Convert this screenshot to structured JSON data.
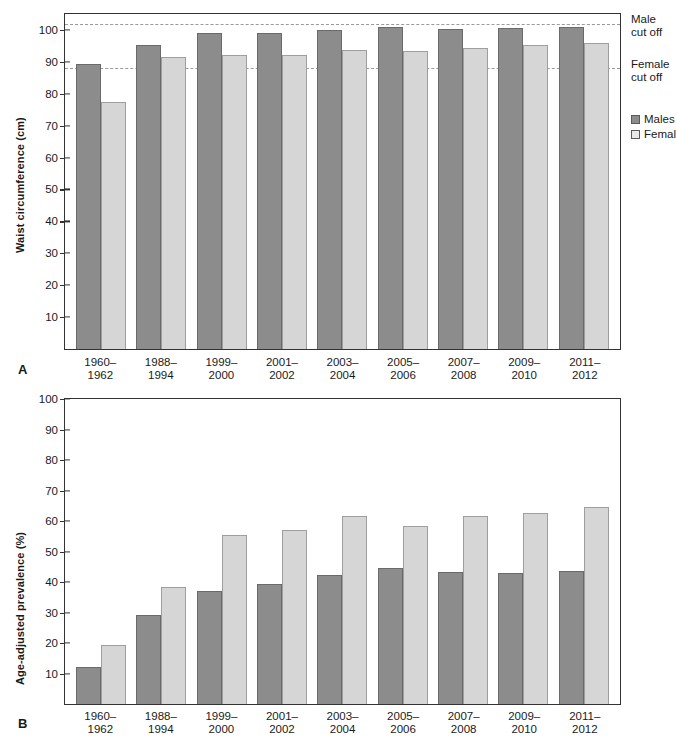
{
  "figure": {
    "panel_a_letter": "A",
    "panel_b_letter": "B"
  },
  "legend": {
    "males_label": "Males",
    "females_label": "Females",
    "male_color": "#8c8c8c",
    "female_color": "#d6d6d6"
  },
  "annotations": {
    "male_cut_off": "Male\ncut off",
    "female_cut_off": "Female\ncut off"
  },
  "chart_data": [
    {
      "type": "bar",
      "panel": "A",
      "title": "",
      "xlabel": "",
      "ylabel": "Waist circumference (cm)",
      "ylim": [
        0,
        105
      ],
      "yticks": [
        10,
        20,
        30,
        40,
        50,
        60,
        70,
        80,
        90,
        100
      ],
      "ytick_labels": [
        "10",
        "20",
        "30",
        "40",
        "50",
        "60",
        "70",
        "80",
        "90",
        "100"
      ],
      "grid": false,
      "legend_position": "right",
      "categories": [
        "1960–1962",
        "1988–1994",
        "1999–2000",
        "2001–2002",
        "2003–2004",
        "2005–2006",
        "2007–2008",
        "2009–2010",
        "2011–2012"
      ],
      "series": [
        {
          "name": "Males",
          "color": "#8c8c8c",
          "values": [
            89.3,
            95.4,
            99.0,
            99.1,
            100.1,
            101.0,
            100.4,
            100.5,
            100.8
          ]
        },
        {
          "name": "Females",
          "color": "#d6d6d6",
          "values": [
            77.3,
            91.5,
            92.2,
            92.2,
            93.8,
            93.3,
            94.4,
            95.2,
            95.8
          ]
        }
      ],
      "reference_lines": [
        {
          "label": "Male cut off",
          "value": 102,
          "style": "dashed",
          "color": "#9a9a9a"
        },
        {
          "label": "Female cut off",
          "value": 88,
          "style": "dashed",
          "color": "#9a9a9a"
        }
      ]
    },
    {
      "type": "bar",
      "panel": "B",
      "title": "",
      "xlabel": "",
      "ylabel": "Age-adjusted prevalence (%)",
      "ylim": [
        0,
        100
      ],
      "yticks": [
        10,
        20,
        30,
        40,
        50,
        60,
        70,
        80,
        90,
        100
      ],
      "ytick_labels": [
        "10",
        "20",
        "30",
        "40",
        "50",
        "60",
        "70",
        "80",
        "90",
        "100"
      ],
      "grid": false,
      "legend_position": "none",
      "categories": [
        "1960–1962",
        "1988–1994",
        "1999–2000",
        "2001–2002",
        "2003–2004",
        "2005–2006",
        "2007–2008",
        "2009–2010",
        "2011–2012"
      ],
      "series": [
        {
          "name": "Males",
          "color": "#8c8c8c",
          "values": [
            12.3,
            29.2,
            37.2,
            39.4,
            42.4,
            44.6,
            43.4,
            42.9,
            43.5
          ]
        },
        {
          "name": "Females",
          "color": "#d6d6d6",
          "values": [
            19.5,
            38.5,
            55.4,
            57.2,
            61.5,
            58.4,
            61.5,
            62.5,
            64.5
          ]
        }
      ],
      "reference_lines": []
    }
  ]
}
